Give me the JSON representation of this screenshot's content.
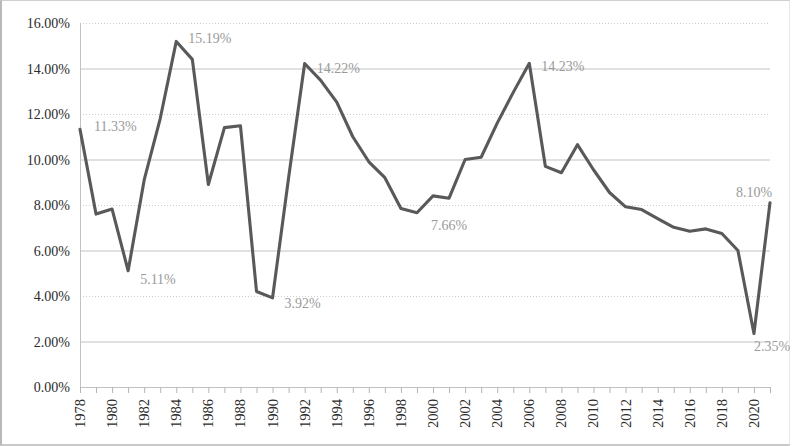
{
  "chart_data": {
    "type": "line",
    "title": "",
    "subtitle": "",
    "xlabel": "",
    "ylabel": "",
    "grid": true,
    "legend": "none",
    "xlim": [
      1978,
      2021
    ],
    "ylim": [
      0,
      16
    ],
    "y_tick_format": "percent",
    "y_ticks": [
      "0.00%",
      "2.00%",
      "4.00%",
      "6.00%",
      "8.00%",
      "10.00%",
      "12.00%",
      "14.00%",
      "16.00%"
    ],
    "y_tick_values": [
      0,
      2,
      4,
      6,
      8,
      10,
      12,
      14,
      16
    ],
    "x_ticks": [
      "1978",
      "1980",
      "1982",
      "1984",
      "1986",
      "1988",
      "1990",
      "1992",
      "1994",
      "1996",
      "1998",
      "2000",
      "2002",
      "2004",
      "2006",
      "2008",
      "2010",
      "2012",
      "2014",
      "2016",
      "2018",
      "2020"
    ],
    "x_tick_values": [
      1978,
      1980,
      1982,
      1984,
      1986,
      1988,
      1990,
      1992,
      1994,
      1996,
      1998,
      2000,
      2002,
      2004,
      2006,
      2008,
      2010,
      2012,
      2014,
      2016,
      2018,
      2020
    ],
    "x": [
      1978,
      1979,
      1980,
      1981,
      1982,
      1983,
      1984,
      1985,
      1986,
      1987,
      1988,
      1989,
      1990,
      1991,
      1992,
      1993,
      1994,
      1995,
      1996,
      1997,
      1998,
      1999,
      2000,
      2001,
      2002,
      2003,
      2004,
      2005,
      2006,
      2007,
      2008,
      2009,
      2010,
      2011,
      2012,
      2013,
      2014,
      2015,
      2016,
      2017,
      2018,
      2019,
      2020,
      2021
    ],
    "values": [
      11.33,
      7.6,
      7.82,
      5.11,
      9.1,
      11.8,
      15.19,
      14.4,
      8.9,
      11.4,
      11.48,
      4.2,
      3.92,
      9.2,
      14.22,
      13.48,
      12.52,
      11.0,
      9.9,
      9.2,
      7.85,
      7.66,
      8.4,
      8.3,
      10.0,
      10.1,
      11.6,
      12.95,
      14.23,
      9.7,
      9.42,
      10.65,
      9.55,
      8.55,
      7.92,
      7.8,
      7.4,
      7.02,
      6.85,
      6.95,
      6.75,
      6.0,
      2.35,
      8.1
    ],
    "annotations": [
      {
        "x": 1978,
        "value": 11.33,
        "label": "11.33%",
        "dx": 14,
        "dy": 2
      },
      {
        "x": 1981,
        "value": 5.11,
        "label": "5.11%",
        "dx": 12,
        "dy": 13
      },
      {
        "x": 1984,
        "value": 15.19,
        "label": "15.19%",
        "dx": 12,
        "dy": 2
      },
      {
        "x": 1990,
        "value": 3.92,
        "label": "3.92%",
        "dx": 12,
        "dy": 10
      },
      {
        "x": 1992,
        "value": 14.22,
        "label": "14.22%",
        "dx": 12,
        "dy": 10
      },
      {
        "x": 1999,
        "value": 7.66,
        "label": "7.66%",
        "dx": 14,
        "dy": 17
      },
      {
        "x": 2006,
        "value": 14.23,
        "label": "14.23%",
        "dx": 12,
        "dy": 8
      },
      {
        "x": 2020,
        "value": 2.35,
        "label": "2.35%",
        "dx": 0,
        "dy": 17
      },
      {
        "x": 2021,
        "value": 8.1,
        "label": "8.10%",
        "dx": -34,
        "dy": -6
      }
    ],
    "series_color": "#595959",
    "label_color": "#9a9a9a",
    "grid_color": "#c2c2c2",
    "background": "#ffffff"
  },
  "plot_box": {
    "left": 78,
    "top": 22,
    "right": 768,
    "bottom": 386
  }
}
